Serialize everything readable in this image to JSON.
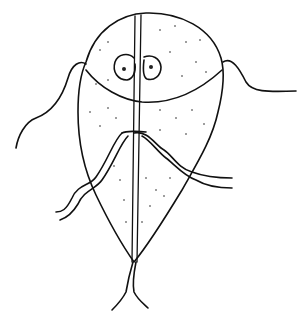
{
  "figure": {
    "caption": "",
    "colors": {
      "ink": "#111111",
      "background": "#ffffff"
    },
    "parts": [
      "body",
      "adhesive-disc",
      "nuclei",
      "axonemes",
      "anterior-flagella",
      "lateral-flagella",
      "posterior-flagella",
      "median-body"
    ]
  }
}
